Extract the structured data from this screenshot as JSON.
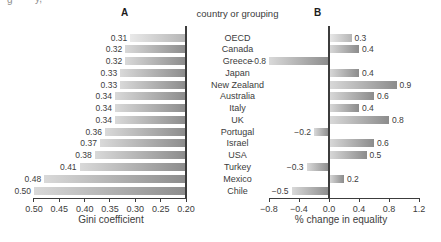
{
  "figure": {
    "panel_a_label": "A",
    "panel_b_label": "B",
    "center_header": "country or grouping",
    "cropped_fragments": [
      "g",
      "y,"
    ]
  },
  "colors": {
    "bar_gradient_start": "#d9d9d9",
    "bar_gradient_end": "#8c8c8c",
    "light_bar_gradient_start": "#e9e9e9",
    "light_bar_gradient_end": "#b5b5b5",
    "axis_color": "#3c3c3c",
    "text_color": "#3c3c3c"
  },
  "chart_data": [
    {
      "type": "bar",
      "panel": "A",
      "orientation": "horizontal",
      "categories": [
        "OECD",
        "Canada",
        "Greece",
        "Japan",
        "New Zealand",
        "Australia",
        "Italy",
        "UK",
        "Portugal",
        "Israel",
        "USA",
        "Turkey",
        "Mexico",
        "Chile"
      ],
      "values": [
        0.31,
        0.32,
        0.32,
        0.33,
        0.33,
        0.34,
        0.34,
        0.34,
        0.36,
        0.37,
        0.38,
        0.41,
        0.48,
        0.5
      ],
      "value_labels": [
        "0.31",
        "0.32",
        "0.32",
        "0.33",
        "0.33",
        "0.34",
        "0.34",
        "0.34",
        "0.36",
        "0.37",
        "0.38",
        "0.41",
        "0.48",
        "0.50"
      ],
      "baseline": 0.2,
      "axis_reversed": true,
      "xlabel": "Gini coefficient",
      "xlim": [
        0.5,
        0.2
      ],
      "xticks": [
        "0.50",
        "0.45",
        "0.40",
        "0.35",
        "0.30",
        "0.25",
        "0.20"
      ],
      "xtick_values": [
        0.5,
        0.45,
        0.4,
        0.35,
        0.3,
        0.25,
        0.2
      ],
      "light_bar_categories": [
        "OECD"
      ],
      "grid": false,
      "legend": false
    },
    {
      "type": "bar",
      "panel": "B",
      "orientation": "horizontal",
      "categories": [
        "OECD",
        "Canada",
        "Greece",
        "Japan",
        "New Zealand",
        "Australia",
        "Italy",
        "UK",
        "Portugal",
        "Israel",
        "USA",
        "Turkey",
        "Mexico",
        "Chile"
      ],
      "values": [
        0.3,
        0.4,
        -0.8,
        0.4,
        0.9,
        0.6,
        0.4,
        0.8,
        -0.2,
        0.6,
        0.5,
        -0.3,
        0.2,
        -0.5
      ],
      "value_labels": [
        "0.3",
        "0.4",
        "−0.8",
        "0.4",
        "0.9",
        "0.6",
        "0.4",
        "0.8",
        "−0.2",
        "0.6",
        "0.5",
        "−0.3",
        "0.2",
        "−0.5"
      ],
      "baseline": 0,
      "axis_reversed": false,
      "xlabel": "% change in equality",
      "xlim": [
        -0.8,
        1.2
      ],
      "xticks": [
        "−0.8",
        "−0.4",
        "0.0",
        "0.4",
        "0.8",
        "1.2"
      ],
      "xtick_values": [
        -0.8,
        -0.4,
        0.0,
        0.4,
        0.8,
        1.2
      ],
      "light_bar_categories": [
        "OECD"
      ],
      "grid": false,
      "legend": false
    }
  ]
}
